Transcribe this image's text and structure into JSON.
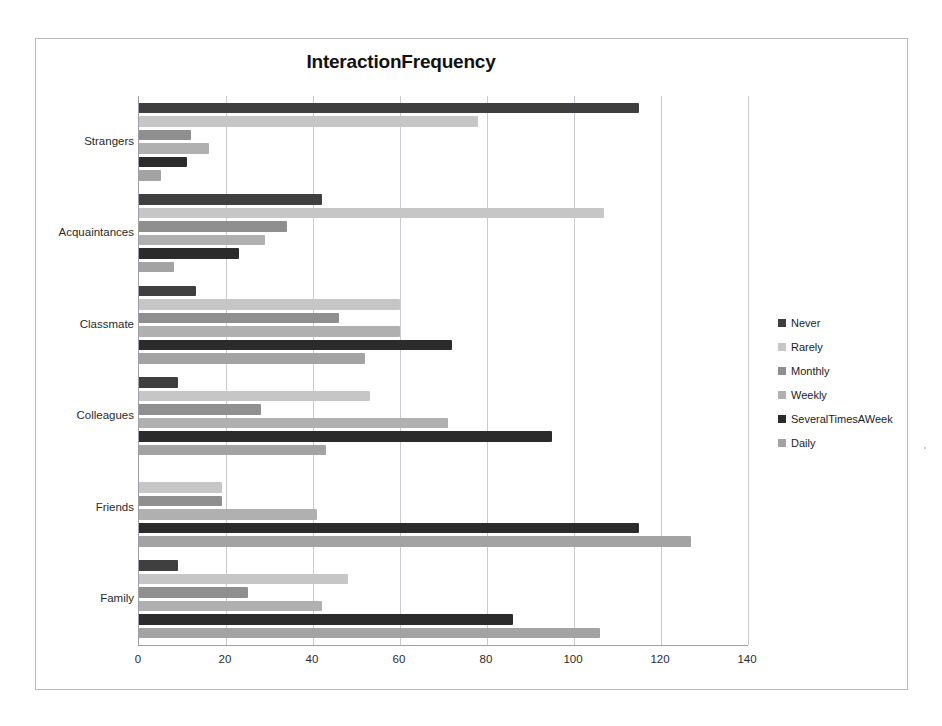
{
  "chart_data": {
    "type": "bar",
    "orientation": "horizontal",
    "title": "InteractionFrequency",
    "xlabel": "",
    "ylabel": "",
    "categories": [
      "Strangers",
      "Acquaintances",
      "Classmate",
      "Colleagues",
      "Friends",
      "Family"
    ],
    "category_order_top_to_bottom": [
      "Strangers",
      "Acquaintances",
      "Classmate",
      "Colleagues",
      "Friends",
      "Family"
    ],
    "series": [
      {
        "name": "Never",
        "color": "#3f3f3f",
        "values": [
          115,
          42,
          13,
          9,
          0,
          9
        ]
      },
      {
        "name": "Rarely",
        "color": "#c6c6c6",
        "values": [
          78,
          107,
          60,
          53,
          19,
          48
        ]
      },
      {
        "name": "Monthly",
        "color": "#8f8f8f",
        "values": [
          12,
          34,
          46,
          28,
          19,
          25
        ]
      },
      {
        "name": "Weekly",
        "color": "#b0b0b0",
        "values": [
          16,
          29,
          60,
          71,
          41,
          42
        ]
      },
      {
        "name": "SeveralTimesAWeek",
        "color": "#2b2b2b",
        "values": [
          11,
          23,
          72,
          95,
          115,
          86
        ]
      },
      {
        "name": "Daily",
        "color": "#a3a3a3",
        "values": [
          5,
          8,
          52,
          43,
          127,
          106
        ]
      }
    ],
    "xticks": [
      0,
      20,
      40,
      60,
      80,
      100,
      120,
      140
    ],
    "xlim": [
      0,
      140
    ],
    "grid": "vertical",
    "legend_position": "right",
    "legend_entries": [
      "Never",
      "Rarely",
      "Monthly",
      "Weekly",
      "SeveralTimesAWeek",
      "Daily"
    ]
  },
  "colors": {
    "frame_border": "#b9b9bd",
    "axis_line": "#9e9ea4",
    "gridline": "#c9c9cf",
    "title_text": "#111111",
    "label_text": "#2a2a2a",
    "background": "#ffffff"
  }
}
